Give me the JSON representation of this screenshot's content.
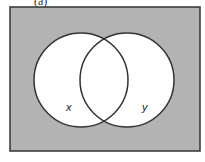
{
  "diagram": {
    "type": "venn",
    "title_fragment": "(a)",
    "universe": {
      "x": 10,
      "y": 7,
      "width": 190,
      "height": 144,
      "fill": "#b3b3b3",
      "stroke": "#333333"
    },
    "sets": [
      {
        "label": "x",
        "cx": 81,
        "cy": 80,
        "r": 47,
        "fill": "#ffffff",
        "label_x": 66,
        "label_y": 111
      },
      {
        "label": "y",
        "cx": 127,
        "cy": 80,
        "r": 47,
        "fill": "#ffffff",
        "label_x": 142,
        "label_y": 111
      }
    ],
    "shaded_region": "complement of (x ∪ y)"
  }
}
